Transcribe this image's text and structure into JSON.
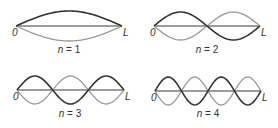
{
  "diagram": {
    "end_labels": {
      "left": "0",
      "right": "L"
    },
    "panels": [
      {
        "id": "n1",
        "label": "n = 1",
        "n": 1,
        "x0": 16,
        "x1": 122,
        "axis_y": 26,
        "amplitude": 15,
        "label_x": 69,
        "label_y": 53
      },
      {
        "id": "n2",
        "label": "n = 2",
        "n": 2,
        "x0": 154,
        "x1": 260,
        "axis_y": 26,
        "amplitude": 14,
        "label_x": 207,
        "label_y": 53
      },
      {
        "id": "n3",
        "label": "n = 3",
        "n": 3,
        "x0": 17,
        "x1": 124,
        "axis_y": 90,
        "amplitude": 14,
        "label_x": 70,
        "label_y": 117
      },
      {
        "id": "n4",
        "label": "n = 4",
        "n": 4,
        "x0": 155,
        "x1": 261,
        "axis_y": 91,
        "amplitude": 14,
        "label_x": 208,
        "label_y": 117
      }
    ],
    "colors": {
      "dark_wave": "#333333",
      "light_wave": "#9a9a9a",
      "axis": "#3a3a3a"
    }
  }
}
